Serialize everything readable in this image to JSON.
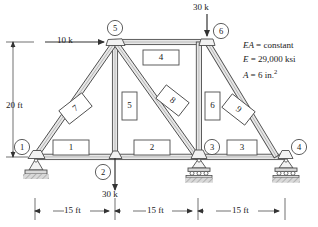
{
  "figure": {
    "properties": [
      {
        "symbol": "EA",
        "eq": "=",
        "value": "constant"
      },
      {
        "symbol": "E",
        "eq": "=",
        "value": "29,000 ksi"
      },
      {
        "symbol": "A",
        "eq": "=",
        "value": "6 in.",
        "sup": "2"
      }
    ],
    "loads": [
      {
        "name": "horizontal-load-node5",
        "label": "10 k",
        "magnitude": 10,
        "unit": "k",
        "direction": "right",
        "applied_at_node": 5
      },
      {
        "name": "vertical-load-node6",
        "label": "30 k",
        "magnitude": 30,
        "unit": "k",
        "direction": "down",
        "applied_at_node": 6
      },
      {
        "name": "vertical-load-node2",
        "label": "30 k",
        "magnitude": 30,
        "unit": "k",
        "direction": "down",
        "applied_at_node": 2
      }
    ],
    "dimensions": {
      "height": {
        "label": "20 ft",
        "value": 20,
        "unit": "ft"
      },
      "spans": [
        {
          "label": "15 ft",
          "value": 15,
          "unit": "ft"
        },
        {
          "label": "15 ft",
          "value": 15,
          "unit": "ft"
        },
        {
          "label": "15 ft",
          "value": 15,
          "unit": "ft"
        }
      ]
    },
    "nodes": [
      {
        "id": "1",
        "label": "1",
        "support": "pin"
      },
      {
        "id": "2",
        "label": "2",
        "support": "none"
      },
      {
        "id": "3",
        "label": "3",
        "support": "roller"
      },
      {
        "id": "4",
        "label": "4",
        "support": "roller"
      },
      {
        "id": "5",
        "label": "5",
        "support": "none"
      },
      {
        "id": "6",
        "label": "6",
        "support": "none"
      }
    ],
    "members": [
      {
        "id": "1",
        "label": "1",
        "from": "1",
        "to": "2",
        "orientation": "horizontal"
      },
      {
        "id": "2",
        "label": "2",
        "from": "2",
        "to": "3",
        "orientation": "horizontal"
      },
      {
        "id": "3",
        "label": "3",
        "from": "3",
        "to": "4",
        "orientation": "horizontal"
      },
      {
        "id": "4",
        "label": "4",
        "from": "5",
        "to": "6",
        "orientation": "horizontal"
      },
      {
        "id": "5",
        "label": "5",
        "from": "5",
        "to": "2",
        "orientation": "vertical"
      },
      {
        "id": "6",
        "label": "6",
        "from": "6",
        "to": "3",
        "orientation": "vertical"
      },
      {
        "id": "7",
        "label": "7",
        "from": "1",
        "to": "5",
        "orientation": "diagonal"
      },
      {
        "id": "8",
        "label": "8",
        "from": "5",
        "to": "3",
        "orientation": "diagonal"
      },
      {
        "id": "9",
        "label": "9",
        "from": "6",
        "to": "4",
        "orientation": "diagonal"
      }
    ],
    "colors": {
      "line": "#4d4d4d",
      "text": "#1a1a1a",
      "hatch": "#b3b3b3",
      "member_fill": "#e8e8e8"
    }
  }
}
